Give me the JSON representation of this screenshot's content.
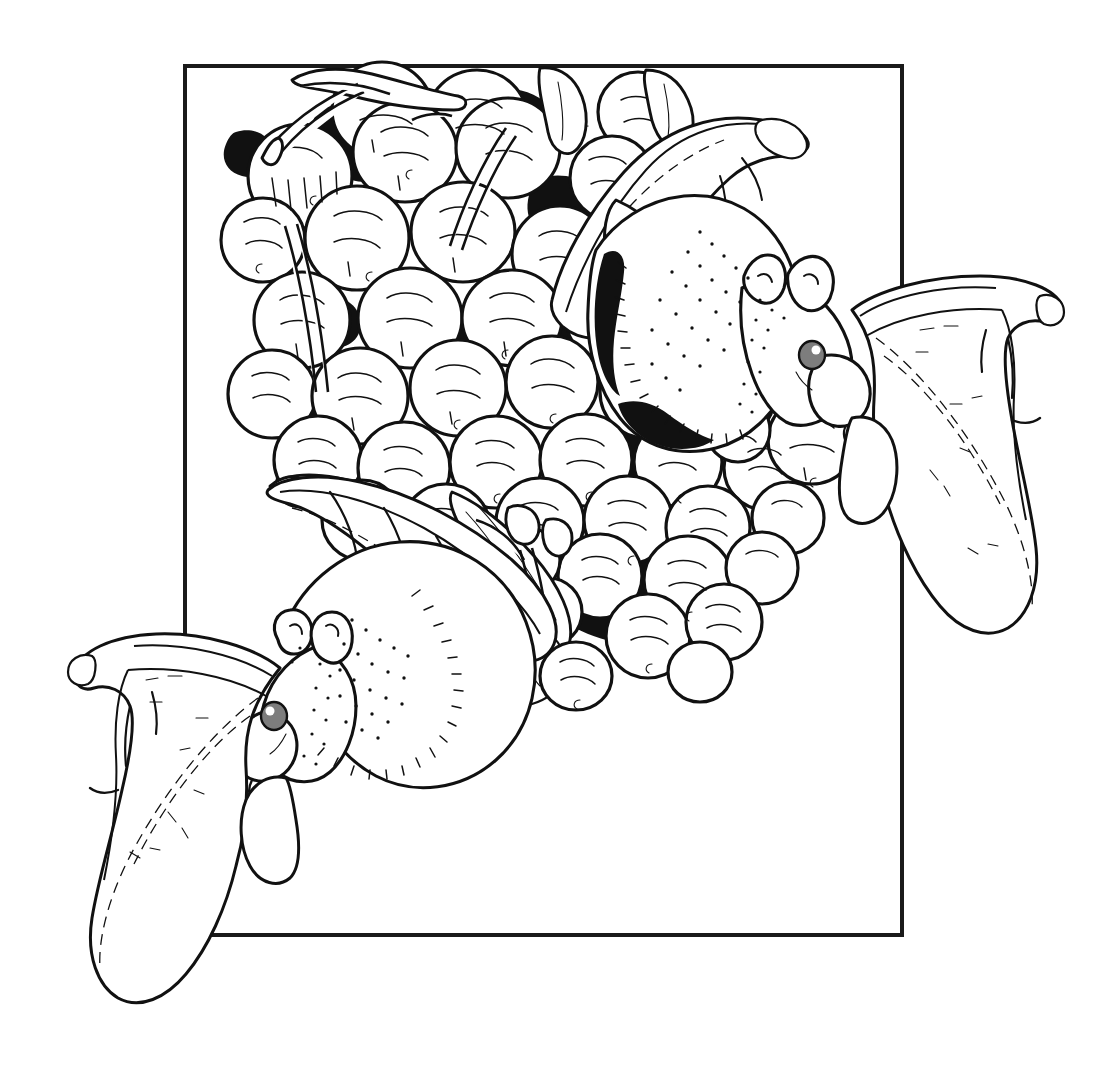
{
  "illustration": {
    "title": "Two fruit bats feeding on a cluster of fruit",
    "medium": "pen-and-ink line drawing",
    "style": "black-and-white scientific illustration",
    "background_color": "#ffffff",
    "ink_color": "#111111",
    "canvas": {
      "width": 1111,
      "height": 1065
    }
  },
  "frame": {
    "name": "rectangular-border",
    "description": "thin black rectangle that the animals overlap and break out of",
    "stroke_color": "#1a1a1a",
    "stroke_width": 4,
    "bounds": {
      "left": 185,
      "top": 66,
      "right": 902,
      "bottom": 935
    }
  },
  "subjects": [
    {
      "id": "bat-upper-right",
      "label": "Upper fruit bat",
      "pose": "clinging upside to the fruit cluster, wings spread, biting a fruit",
      "head_center": {
        "x": 790,
        "y": 350
      },
      "eye": {
        "x": 812,
        "y": 355,
        "radius": 11,
        "iris_color": "#7d7d7d"
      },
      "facing": "right",
      "notes": "muzzle gripping a single round fruit; right wing extends past the frame edge"
    },
    {
      "id": "bat-lower-left",
      "label": "Lower fruit bat",
      "pose": "hanging beneath the cluster, head down-left, wings spread",
      "head_center": {
        "x": 300,
        "y": 710
      },
      "eye": {
        "x": 274,
        "y": 716,
        "radius": 11,
        "iris_color": "#7d7d7d"
      },
      "facing": "left",
      "notes": "left wing breaks out below and left of the frame border"
    }
  ],
  "fruit_cluster": {
    "label": "Cluster of round fruits",
    "count_visible": 44,
    "fill": "#ffffff",
    "outline": "#111111",
    "interstices_fill": "#111111",
    "description": "dense bunch of spherical berries with curved hatch shading, dark gaps between fruits"
  },
  "foliage": {
    "leaves_visible": 6,
    "description": "narrow lanceolate leaves and stems emerging from behind the fruit cluster"
  }
}
